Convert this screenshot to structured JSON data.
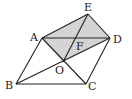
{
  "diagram": {
    "type": "geometry",
    "colors": {
      "line": "#222222",
      "shade": "#d4d4d4",
      "background": "#ffffff"
    },
    "points": {
      "A": {
        "label": "A",
        "x": 42,
        "y": 38
      },
      "B": {
        "label": "B",
        "x": 16,
        "y": 84
      },
      "C": {
        "label": "C",
        "x": 86,
        "y": 84
      },
      "D": {
        "label": "D",
        "x": 110,
        "y": 38
      },
      "E": {
        "label": "E",
        "x": 88,
        "y": 14
      },
      "O": {
        "label": "O",
        "x": 63,
        "y": 62
      },
      "F": {
        "label": "F",
        "x": 75,
        "y": 38
      }
    },
    "shaded_region": [
      "A",
      "E",
      "D",
      "O"
    ],
    "segments": [
      [
        "A",
        "B"
      ],
      [
        "B",
        "C"
      ],
      [
        "C",
        "D"
      ],
      [
        "A",
        "D"
      ],
      [
        "A",
        "E"
      ],
      [
        "E",
        "D"
      ],
      [
        "A",
        "C"
      ],
      [
        "B",
        "D"
      ],
      [
        "E",
        "O"
      ]
    ]
  }
}
